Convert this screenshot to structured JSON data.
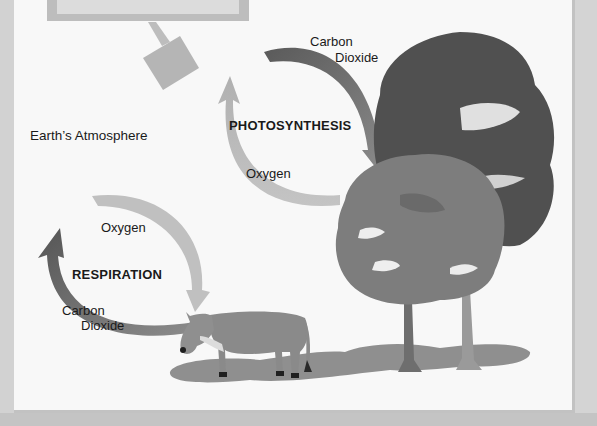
{
  "diagram": {
    "atmosphere_label": "Earth’s Atmosphere",
    "photosynthesis": {
      "title": "PHOTOSYNTHESIS",
      "input_label_line1": "Carbon",
      "input_label_line2": "Dioxide",
      "output_label": "Oxygen"
    },
    "respiration": {
      "title": "RESPIRATION",
      "input_label": "Oxygen",
      "output_label_line1": "Carbon",
      "output_label_line2": "Dioxide"
    },
    "illustrations": {
      "animal": "cow",
      "plants": "trees",
      "sun_icon": "gray square symbol"
    },
    "colors": {
      "panel_bg": "#f8f8f8",
      "frame": "#c9c9c9",
      "co2_arrow": "#6e6e6e",
      "o2_arrow": "#b8b8b8",
      "text": "#1a1a1a"
    }
  }
}
